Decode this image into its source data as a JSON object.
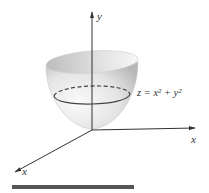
{
  "figure": {
    "surface_label": "z = x² + y²",
    "axis_labels": {
      "vertical": "y",
      "right": "x",
      "diagonal": "x"
    },
    "colors": {
      "axis": "#333333",
      "surface_light": "#f4f4f4",
      "surface_dark": "#bdbdbd",
      "ring": "#444444",
      "bar": "#555555"
    }
  }
}
